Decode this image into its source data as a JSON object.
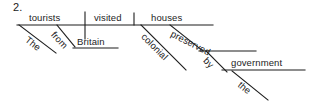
{
  "exercise": {
    "number": "2."
  },
  "diagram": {
    "type": "reed-kellogg-sentence-diagram",
    "sentence": "The tourists from Britain visited colonial houses preserved by the government.",
    "ink_color": "#1d1d1d",
    "background_color": "#ffffff",
    "words": {
      "subject": "tourists",
      "verb": "visited",
      "direct_object": "houses",
      "subject_article": "The",
      "subject_preposition": "from",
      "preposition_object": "Britain",
      "object_adjective": "colonial",
      "object_participle": "preserved",
      "agent_preposition": "by",
      "agent_object": "government",
      "agent_article": "the"
    },
    "lines": {
      "baseline": {
        "x1": 17,
        "y1": 25,
        "x2": 213,
        "y2": 25
      },
      "subject_verb_divider": {
        "x1": 85,
        "y1": 12,
        "x2": 85,
        "y2": 39
      },
      "verb_object_divider": {
        "x1": 134,
        "y1": 13,
        "x2": 134,
        "y2": 25
      },
      "article_the1_diagonal": {
        "x1": 19,
        "y1": 25,
        "x2": 56,
        "y2": 53
      },
      "prep_from_diagonal": {
        "x1": 57,
        "y1": 25,
        "x2": 75,
        "y2": 47
      },
      "britain_baseline": {
        "x1": 73,
        "y1": 48,
        "x2": 118,
        "y2": 48
      },
      "adj_colonial_diagonal": {
        "x1": 141,
        "y1": 25,
        "x2": 186,
        "y2": 70
      },
      "participle_preserved_diagonal": {
        "x1": 170,
        "y1": 25,
        "x2": 203,
        "y2": 51
      },
      "preserved_baseline": {
        "x1": 199,
        "y1": 51,
        "x2": 256,
        "y2": 51
      },
      "prep_by_diagonal": {
        "x1": 206,
        "y1": 51,
        "x2": 227,
        "y2": 72
      },
      "government_baseline": {
        "x1": 222,
        "y1": 70,
        "x2": 305,
        "y2": 70
      },
      "article_the2_diagonal": {
        "x1": 232,
        "y1": 71,
        "x2": 268,
        "y2": 100
      }
    }
  }
}
